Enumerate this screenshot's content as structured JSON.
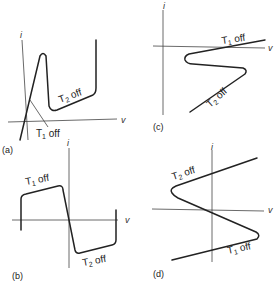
{
  "figure": {
    "axes": {
      "x_label": "v",
      "y_label": "i"
    },
    "panels": [
      {
        "id": "a",
        "label": "(a)",
        "annotations": [
          {
            "text": "T",
            "sub": "2",
            "suffix": " off"
          },
          {
            "text": "T",
            "sub": "1",
            "suffix": " off"
          }
        ]
      },
      {
        "id": "b",
        "label": "(b)",
        "annotations": [
          {
            "text": "T",
            "sub": "1",
            "suffix": " off"
          },
          {
            "text": "T",
            "sub": "2",
            "suffix": " off"
          }
        ]
      },
      {
        "id": "c",
        "label": "(c)",
        "annotations": [
          {
            "text": "T",
            "sub": "1",
            "suffix": " off"
          },
          {
            "text": "T",
            "sub": "2",
            "suffix": " off"
          }
        ]
      },
      {
        "id": "d",
        "label": "(d)",
        "annotations": [
          {
            "text": "T",
            "sub": "2",
            "suffix": " off"
          },
          {
            "text": "T",
            "sub": "1",
            "suffix": " off"
          }
        ]
      }
    ]
  }
}
